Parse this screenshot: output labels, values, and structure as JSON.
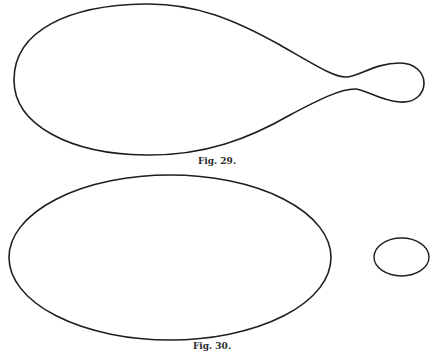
{
  "figures": [
    {
      "id": "fig29",
      "caption": "Fig. 29.",
      "shape": "pear-shaped closed curve with narrow neck and small bulb at right"
    },
    {
      "id": "fig30",
      "caption": "Fig. 30.",
      "shape": "large ellipse with separate small ellipse to the right"
    }
  ],
  "style": {
    "stroke_color": "#1e1e1e",
    "background": "#ffffff"
  }
}
